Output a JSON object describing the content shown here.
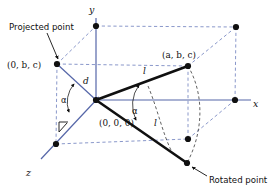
{
  "figure": {
    "background_color": "#ffffff",
    "axis_color": "#5566a8",
    "dashed_color": "#7d8cc4",
    "segment_color": "#101010"
  },
  "axes": {
    "x_label": "x",
    "y_label": "y",
    "z_label": "z"
  },
  "annotations": {
    "projected_point_caption": "Projected point",
    "rotated_point_caption": "Rotated point",
    "origin_label": "(0, 0, 0)",
    "projected_coord_label": "(0, b, c)",
    "point_coord_label": "(a, b, c)",
    "distance_label": "d",
    "length_label_upper": "l",
    "length_label_lower": "l",
    "angle_label_left": "α",
    "angle_label_right": "α"
  },
  "points": [
    {
      "name": "origin",
      "label": "(0, 0, 0)",
      "x": 96,
      "y": 100
    },
    {
      "name": "y-axis-point",
      "label": "",
      "x": 96,
      "y": 26
    },
    {
      "name": "x-axis-point",
      "label": "",
      "x": 235,
      "y": 100
    },
    {
      "name": "z-axis-point",
      "label": "",
      "x": 56,
      "y": 144
    },
    {
      "name": "projected-point",
      "label": "(0, b, c)",
      "x": 57,
      "y": 64
    },
    {
      "name": "original-point",
      "label": "(a, b, c)",
      "x": 188,
      "y": 66
    },
    {
      "name": "rotated-point",
      "label": "",
      "x": 187,
      "y": 163
    },
    {
      "name": "box-corner-top-right",
      "label": "",
      "x": 236,
      "y": 27
    },
    {
      "name": "box-corner-bottom",
      "label": "",
      "x": 188,
      "y": 139
    }
  ]
}
